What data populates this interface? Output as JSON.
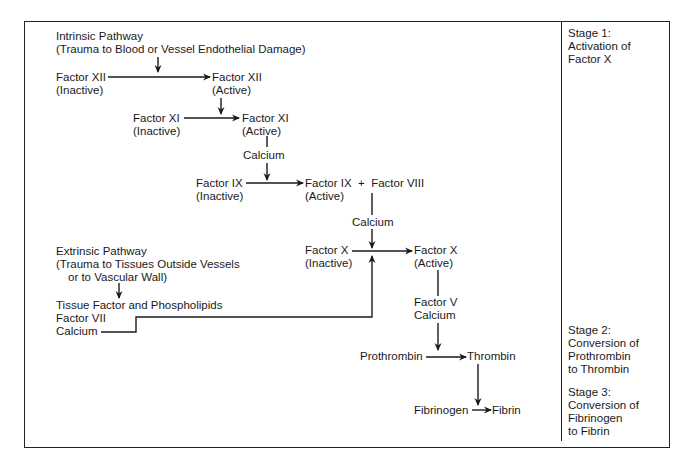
{
  "diagram": {
    "intrinsic": {
      "title": "Intrinsic Pathway",
      "subtitle": "(Trauma to Blood or Vessel Endothelial Damage)"
    },
    "extrinsic": {
      "title": "Extrinsic Pathway",
      "subtitle_line1": "(Trauma to Tissues Outside Vessels",
      "subtitle_line2": "or to Vascular Wall)",
      "factors_line1": "Tissue Factor and Phospholipids",
      "factors_line2": "Factor VII",
      "factors_line3": "Calcium"
    },
    "nodes": {
      "f12_inactive": {
        "name": "Factor XII",
        "state": "(Inactive)"
      },
      "f12_active": {
        "name": "Factor XII",
        "state": "(Active)"
      },
      "f11_inactive": {
        "name": "Factor XI",
        "state": "(Inactive)"
      },
      "f11_active": {
        "name": "Factor XI",
        "state": "(Active)"
      },
      "calcium_1": "Calcium",
      "f9_inactive": {
        "name": "Factor IX",
        "state": "(Inactive)"
      },
      "f9_active": {
        "name": "Factor IX  +  Factor VIII",
        "state": "(Active)"
      },
      "calcium_2": "Calcium",
      "f10_inactive": {
        "name": "Factor X",
        "state": "(Inactive)"
      },
      "f10_active": {
        "name": "Factor X",
        "state": "(Active)"
      },
      "cofactors_line1": "Factor V",
      "cofactors_line2": "Calcium",
      "prothrombin": "Prothrombin",
      "thrombin": "Thrombin",
      "fibrinogen": "Fibrinogen",
      "fibrin": "Fibrin"
    },
    "stages": [
      {
        "lines": [
          "Stage 1:",
          "Activation of",
          "Factor X"
        ]
      },
      {
        "lines": [
          "Stage 2:",
          "Conversion of",
          "Prothrombin",
          "to Thrombin"
        ]
      },
      {
        "lines": [
          "Stage 3:",
          "Conversion of",
          "Fibrinogen",
          "to Fibrin"
        ]
      }
    ],
    "colors": {
      "line": "#1a1a1a",
      "background": "#ffffff"
    }
  }
}
